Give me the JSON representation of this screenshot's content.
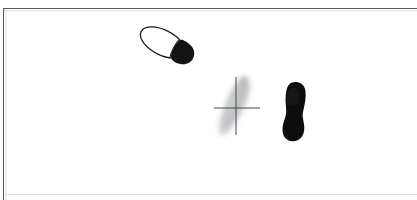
{
  "panel": {
    "name": "figure-plate",
    "background_color": "#ffffff",
    "border_color": "#555a5e",
    "bottom_rule_color": "#d8dadc",
    "left_px": 3,
    "top_px": 8,
    "width_px": 414,
    "height_px": 192
  },
  "figures": [
    {
      "id": "outlined-shoeprint",
      "label": "",
      "description": "shoe outline with filled black heel",
      "shape": "ellipse-outline-with-heel",
      "fill": "none",
      "outline_color": "#1a1a1a",
      "heel_color": "#121212",
      "rotation_deg": 28,
      "center_x_px": 163,
      "center_y_px": 38,
      "width_px": 66,
      "height_px": 44
    },
    {
      "id": "faint-partial-print",
      "label": "",
      "description": "faint grey smudged partial shoeprint with registration crosshair",
      "shape": "blurred-elongated-smear",
      "fill": "#c2c4c6",
      "outline_color": "none",
      "rotation_deg": 20,
      "center_x_px": 232,
      "center_y_px": 97,
      "width_px": 38,
      "height_px": 66
    },
    {
      "id": "solid-black-sole",
      "label": "",
      "description": "solid black shoe sole silhouette",
      "shape": "sole-silhouette",
      "fill": "#111111",
      "outline_color": "none",
      "rotation_deg": 4,
      "center_x_px": 284,
      "center_y_px": 102,
      "width_px": 24,
      "height_px": 58
    }
  ],
  "crosshair": {
    "name": "registration-crosshair",
    "color": "#4a4a4a",
    "center_x_px": 232,
    "center_y_px": 99,
    "horizontal_from_x_px": 210,
    "horizontal_to_x_px": 256,
    "vertical_from_y_px": 68,
    "vertical_to_y_px": 126,
    "line_width_px": 1
  }
}
